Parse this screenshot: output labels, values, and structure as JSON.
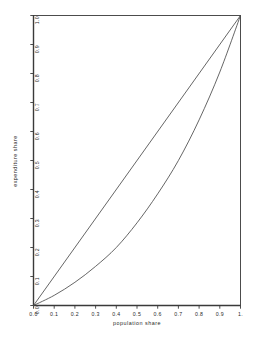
{
  "chart_data": {
    "type": "line",
    "title": "",
    "xlabel": "population share",
    "ylabel": "expenditure share",
    "xlim": [
      0,
      1
    ],
    "ylim": [
      0,
      1
    ],
    "grid": false,
    "legend": "none",
    "xticks": [
      "0.0",
      "0.1",
      "0.2",
      "0.3",
      "0.4",
      "0.5",
      "0.6",
      "0.7",
      "0.8",
      "0.9",
      "1."
    ],
    "xtick_values": [
      0,
      0.1,
      0.2,
      0.3,
      0.4,
      0.5,
      0.6,
      0.7,
      0.8,
      0.9,
      1
    ],
    "yticks": [
      "0.0",
      "0.1",
      "0.2",
      "0.3",
      "0.4",
      "0.5",
      "0.6",
      "0.7",
      "0.8",
      "0.9",
      "1.0"
    ],
    "ytick_values": [
      0,
      0.1,
      0.2,
      0.3,
      0.4,
      0.5,
      0.6,
      0.7,
      0.8,
      0.9,
      1
    ],
    "series": [
      {
        "name": "line of equality",
        "x": [
          0,
          1
        ],
        "values": [
          0,
          1
        ],
        "color": "#4a4a4a"
      },
      {
        "name": "lorenz curve",
        "x": [
          0,
          0.1,
          0.2,
          0.3,
          0.4,
          0.5,
          0.6,
          0.7,
          0.8,
          0.9,
          1
        ],
        "values": [
          0,
          0.035,
          0.08,
          0.135,
          0.2,
          0.285,
          0.385,
          0.5,
          0.64,
          0.805,
          1
        ],
        "color": "#4a4a4a"
      }
    ]
  },
  "axes": {
    "frame_color": "#3a3a3a"
  }
}
